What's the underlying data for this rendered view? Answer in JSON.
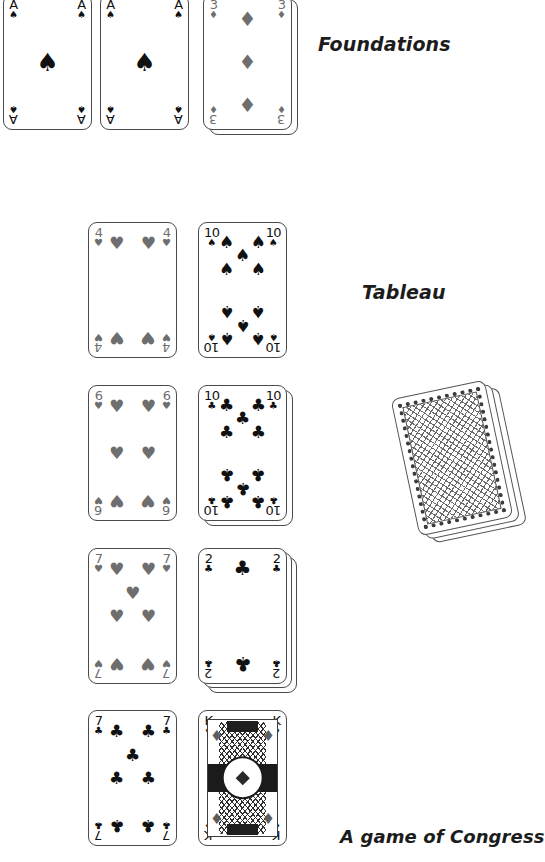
{
  "labels": {
    "foundations": "Foundations",
    "tableau": "Tableau",
    "caption": "A game of Congress"
  },
  "suit_glyphs": {
    "spade": "♠",
    "heart": "♥",
    "diamond": "♦",
    "club": "♣"
  },
  "colors": {
    "black_suit": "#111111",
    "red_suit_grayscale": "#6e6e6e",
    "card_border": "#4a4a4a",
    "card_face": "#ffffff",
    "label_text": "#1c1c1c"
  },
  "foundations": {
    "label": "Foundations",
    "piles": [
      {
        "rank": "A",
        "suit": "spade",
        "suit_glyph": "♠",
        "color": "black",
        "stacked_under": 0
      },
      {
        "rank": "A",
        "suit": "spade",
        "suit_glyph": "♠",
        "color": "black",
        "stacked_under": 0
      },
      {
        "rank": "3",
        "suit": "diamond",
        "suit_glyph": "♦",
        "color": "gray",
        "stacked_under": 1
      }
    ]
  },
  "tableau": {
    "label": "Tableau",
    "rows": [
      {
        "left": {
          "rank": "4",
          "suit": "heart",
          "suit_glyph": "♥",
          "color": "gray",
          "stacked_under": 0
        },
        "right": {
          "rank": "10",
          "suit": "spade",
          "suit_glyph": "♠",
          "color": "black",
          "stacked_under": 0
        }
      },
      {
        "left": {
          "rank": "6",
          "suit": "heart",
          "suit_glyph": "♥",
          "color": "gray",
          "stacked_under": 0
        },
        "right": {
          "rank": "10",
          "suit": "club",
          "suit_glyph": "♣",
          "color": "black",
          "stacked_under": 1
        }
      },
      {
        "left": {
          "rank": "7",
          "suit": "heart",
          "suit_glyph": "♥",
          "color": "gray",
          "stacked_under": 0
        },
        "right": {
          "rank": "2",
          "suit": "club",
          "suit_glyph": "♣",
          "color": "black",
          "stacked_under": 2
        }
      },
      {
        "left": {
          "rank": "7",
          "suit": "club",
          "suit_glyph": "♣",
          "color": "black",
          "stacked_under": 0
        },
        "right": {
          "rank": "K",
          "suit": "diamond",
          "suit_glyph": "♦",
          "color": "black",
          "stacked_under": 0,
          "court": true
        }
      }
    ]
  },
  "stock": {
    "name": "stock-pile",
    "face_down": true,
    "cards_visible": 3,
    "rotation_degrees": -12,
    "back_pattern": "diagonal-lattice-with-dotted-border"
  }
}
